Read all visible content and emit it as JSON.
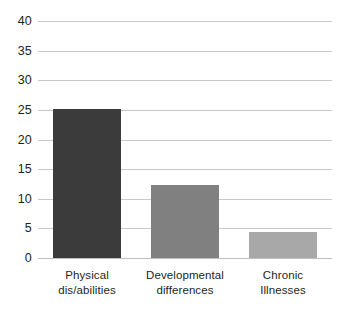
{
  "chart_data": {
    "type": "bar",
    "title": "",
    "subtitle": "",
    "xlabel": "",
    "ylabel": "",
    "categories": [
      "Physical dis/abilities",
      "Developmental differences",
      "Chronic Illnesses"
    ],
    "category_lines": [
      [
        "Physical",
        "dis/abilities"
      ],
      [
        "Developmental",
        "differences"
      ],
      [
        "Chronic",
        "Illnesses"
      ]
    ],
    "values": [
      25.2,
      12.3,
      4.4
    ],
    "bar_colors": [
      "#3b3b3b",
      "#808080",
      "#a8a8a8"
    ],
    "ylim": [
      0,
      40
    ],
    "ytick_step": 5,
    "ytick_labels": [
      "40",
      "35",
      "30",
      "25",
      "20",
      "15",
      "10",
      "5",
      "0"
    ],
    "ytick_values": [
      40,
      35,
      30,
      25,
      20,
      15,
      10,
      5,
      0
    ],
    "grid": true,
    "grid_color": "#c9c9cc",
    "legend": null,
    "legend_position": "none",
    "axis_text_color": "#231f20",
    "background_color": "#ffffff"
  }
}
